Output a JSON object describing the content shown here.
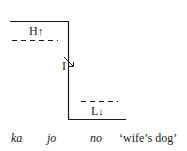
{
  "diagram": {
    "tone_levels": {
      "high": "H",
      "high_arrow": "↑",
      "mid": "I",
      "mid_arrow": "↘",
      "low": "L",
      "low_arrow": "↓"
    },
    "words": [
      "ka",
      "jo",
      "no"
    ],
    "gloss": "‘wife’s dog’",
    "colors": {
      "line": "#1a1a1a",
      "background": "#ffffff"
    }
  }
}
